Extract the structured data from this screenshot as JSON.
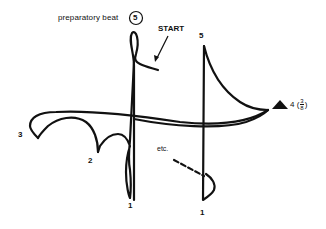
{
  "diagram": {
    "labels": {
      "preparatory": "preparatory beat",
      "preparatory_circle": "5",
      "start": "START",
      "beat5": "5",
      "beat4": "4",
      "beat4_paren_open": "(",
      "beat4_paren_close": ")",
      "meter_numerator": "3",
      "meter_denominator": "8",
      "beat3": "3",
      "beat2": "2",
      "beat1_first": "1",
      "beat1_second": "1",
      "etc": "etc."
    },
    "colors": {
      "ink": "#111111",
      "background": "#ffffff"
    },
    "markers": {
      "beat4_marker": "triangle"
    }
  }
}
